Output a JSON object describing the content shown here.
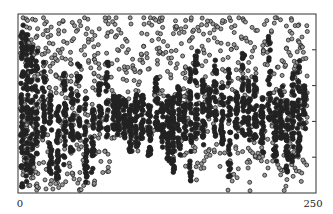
{
  "chart_data": {
    "type": "scatter",
    "title": "",
    "xlabel": "",
    "ylabel": "",
    "xlim": [
      0,
      250
    ],
    "ylim": [
      0,
      1
    ],
    "x_tick_labels": [
      {
        "value": 0,
        "label": "0"
      },
      {
        "value": 250,
        "label": "250"
      }
    ],
    "y_ticks_right": [
      0.2,
      0.4,
      0.6,
      0.8
    ],
    "grid": false,
    "legend": null,
    "marker": "open-circle, dense regions filled black",
    "marker_color": "#222222",
    "fill_color_sparse": "#9a9a9a",
    "columns": [
      {
        "x": 2,
        "dense": [
          0.02,
          0.95
        ],
        "sparse": [
          0.0,
          1.0
        ],
        "n_dense": 60,
        "n_sparse": 25
      },
      {
        "x": 6,
        "dense": [
          0.05,
          0.9
        ],
        "sparse": [
          0.0,
          1.0
        ],
        "n_dense": 50,
        "n_sparse": 25
      },
      {
        "x": 10,
        "dense": [
          0.1,
          0.85
        ],
        "sparse": [
          0.02,
          1.0
        ],
        "n_dense": 45,
        "n_sparse": 25
      },
      {
        "x": 14,
        "dense": [
          0.2,
          0.8
        ],
        "sparse": [
          0.0,
          1.0
        ],
        "n_dense": 30,
        "n_sparse": 30
      },
      {
        "x": 20,
        "dense": [
          0.3,
          0.75
        ],
        "sparse": [
          0.0,
          1.0
        ],
        "n_dense": 25,
        "n_sparse": 30
      },
      {
        "x": 26,
        "dense": [
          0.1,
          0.6
        ],
        "sparse": [
          0.0,
          1.0
        ],
        "n_dense": 30,
        "n_sparse": 30
      },
      {
        "x": 32,
        "dense": [
          0.05,
          0.5
        ],
        "sparse": [
          0.0,
          1.0
        ],
        "n_dense": 30,
        "n_sparse": 30
      },
      {
        "x": 38,
        "dense": [
          0.15,
          0.7
        ],
        "sparse": [
          0.0,
          1.0
        ],
        "n_dense": 30,
        "n_sparse": 30
      },
      {
        "x": 44,
        "dense": [
          0.2,
          0.6
        ],
        "sparse": [
          0.02,
          1.0
        ],
        "n_dense": 25,
        "n_sparse": 28
      },
      {
        "x": 50,
        "dense": [
          0.3,
          0.75
        ],
        "sparse": [
          0.0,
          1.0
        ],
        "n_dense": 25,
        "n_sparse": 28
      },
      {
        "x": 56,
        "dense": [
          0.05,
          0.55
        ],
        "sparse": [
          0.0,
          1.0
        ],
        "n_dense": 30,
        "n_sparse": 25
      },
      {
        "x": 62,
        "dense": [
          0.1,
          0.5
        ],
        "sparse": [
          0.02,
          1.0
        ],
        "n_dense": 25,
        "n_sparse": 25
      },
      {
        "x": 68,
        "dense": [
          0.35,
          0.65
        ],
        "sparse": [
          0.1,
          1.0
        ],
        "n_dense": 25,
        "n_sparse": 20
      },
      {
        "x": 74,
        "dense": [
          0.3,
          0.75
        ],
        "sparse": [
          0.1,
          1.0
        ],
        "n_dense": 25,
        "n_sparse": 20
      },
      {
        "x": 80,
        "dense": [
          0.35,
          0.55
        ],
        "sparse": [
          0.3,
          1.0
        ],
        "n_dense": 30,
        "n_sparse": 15
      },
      {
        "x": 84,
        "dense": [
          0.3,
          0.55
        ],
        "sparse": [
          0.3,
          1.0
        ],
        "n_dense": 30,
        "n_sparse": 12
      },
      {
        "x": 89,
        "dense": [
          0.3,
          0.55
        ],
        "sparse": [
          0.3,
          1.0
        ],
        "n_dense": 30,
        "n_sparse": 12
      },
      {
        "x": 94,
        "dense": [
          0.2,
          0.5
        ],
        "sparse": [
          0.2,
          1.0
        ],
        "n_dense": 35,
        "n_sparse": 12
      },
      {
        "x": 99,
        "dense": [
          0.25,
          0.55
        ],
        "sparse": [
          0.2,
          1.0
        ],
        "n_dense": 30,
        "n_sparse": 12
      },
      {
        "x": 104,
        "dense": [
          0.3,
          0.55
        ],
        "sparse": [
          0.3,
          1.0
        ],
        "n_dense": 30,
        "n_sparse": 14
      },
      {
        "x": 110,
        "dense": [
          0.2,
          0.5
        ],
        "sparse": [
          0.2,
          1.0
        ],
        "n_dense": 35,
        "n_sparse": 14
      },
      {
        "x": 116,
        "dense": [
          0.35,
          0.65
        ],
        "sparse": [
          0.3,
          1.0
        ],
        "n_dense": 30,
        "n_sparse": 18
      },
      {
        "x": 121,
        "dense": [
          0.25,
          0.5
        ],
        "sparse": [
          0.3,
          1.0
        ],
        "n_dense": 30,
        "n_sparse": 14
      },
      {
        "x": 126,
        "dense": [
          0.15,
          0.55
        ],
        "sparse": [
          0.2,
          1.0
        ],
        "n_dense": 40,
        "n_sparse": 14
      },
      {
        "x": 130,
        "dense": [
          0.1,
          0.55
        ],
        "sparse": [
          0.1,
          1.0
        ],
        "n_dense": 45,
        "n_sparse": 14
      },
      {
        "x": 135,
        "dense": [
          0.2,
          0.6
        ],
        "sparse": [
          0.2,
          1.0
        ],
        "n_dense": 35,
        "n_sparse": 14
      },
      {
        "x": 140,
        "dense": [
          0.3,
          0.55
        ],
        "sparse": [
          0.1,
          1.0
        ],
        "n_dense": 25,
        "n_sparse": 18
      },
      {
        "x": 145,
        "dense": [
          0.05,
          0.7
        ],
        "sparse": [
          0.0,
          1.0
        ],
        "n_dense": 35,
        "n_sparse": 20
      },
      {
        "x": 150,
        "dense": [
          0.3,
          0.8
        ],
        "sparse": [
          0.05,
          1.0
        ],
        "n_dense": 30,
        "n_sparse": 22
      },
      {
        "x": 156,
        "dense": [
          0.25,
          0.65
        ],
        "sparse": [
          0.0,
          1.0
        ],
        "n_dense": 30,
        "n_sparse": 20
      },
      {
        "x": 161,
        "dense": [
          0.4,
          0.6
        ],
        "sparse": [
          0.2,
          1.0
        ],
        "n_dense": 25,
        "n_sparse": 15
      },
      {
        "x": 166,
        "dense": [
          0.3,
          0.75
        ],
        "sparse": [
          0.2,
          1.0
        ],
        "n_dense": 30,
        "n_sparse": 15
      },
      {
        "x": 172,
        "dense": [
          0.25,
          0.6
        ],
        "sparse": [
          0.1,
          1.0
        ],
        "n_dense": 30,
        "n_sparse": 18
      },
      {
        "x": 178,
        "dense": [
          0.05,
          0.7
        ],
        "sparse": [
          0.0,
          1.0
        ],
        "n_dense": 30,
        "n_sparse": 20
      },
      {
        "x": 184,
        "dense": [
          0.3,
          0.6
        ],
        "sparse": [
          0.05,
          1.0
        ],
        "n_dense": 25,
        "n_sparse": 18
      },
      {
        "x": 190,
        "dense": [
          0.3,
          0.8
        ],
        "sparse": [
          0.1,
          1.0
        ],
        "n_dense": 30,
        "n_sparse": 18
      },
      {
        "x": 195,
        "dense": [
          0.25,
          0.65
        ],
        "sparse": [
          0.0,
          1.0
        ],
        "n_dense": 30,
        "n_sparse": 20
      },
      {
        "x": 200,
        "dense": [
          0.3,
          0.65
        ],
        "sparse": [
          0.1,
          1.0
        ],
        "n_dense": 30,
        "n_sparse": 18
      },
      {
        "x": 206,
        "dense": [
          0.2,
          0.55
        ],
        "sparse": [
          0.05,
          1.0
        ],
        "n_dense": 30,
        "n_sparse": 18
      },
      {
        "x": 212,
        "dense": [
          0.4,
          0.9
        ],
        "sparse": [
          0.1,
          1.0
        ],
        "n_dense": 25,
        "n_sparse": 16
      },
      {
        "x": 217,
        "dense": [
          0.15,
          0.55
        ],
        "sparse": [
          0.05,
          1.0
        ],
        "n_dense": 35,
        "n_sparse": 18
      },
      {
        "x": 222,
        "dense": [
          0.3,
          0.6
        ],
        "sparse": [
          0.05,
          1.0
        ],
        "n_dense": 30,
        "n_sparse": 18
      },
      {
        "x": 227,
        "dense": [
          0.1,
          0.55
        ],
        "sparse": [
          0.0,
          1.0
        ],
        "n_dense": 35,
        "n_sparse": 20
      },
      {
        "x": 232,
        "dense": [
          0.15,
          0.7
        ],
        "sparse": [
          0.05,
          1.0
        ],
        "n_dense": 35,
        "n_sparse": 22
      },
      {
        "x": 237,
        "dense": [
          0.2,
          0.75
        ],
        "sparse": [
          0.05,
          1.0
        ],
        "n_dense": 35,
        "n_sparse": 22
      },
      {
        "x": 242,
        "dense": [
          0.35,
          0.6
        ],
        "sparse": [
          0.1,
          1.0
        ],
        "n_dense": 25,
        "n_sparse": 22
      }
    ]
  }
}
